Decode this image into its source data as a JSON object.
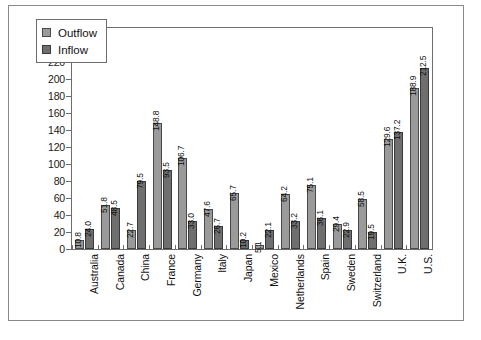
{
  "chart_data": {
    "type": "bar",
    "title": "",
    "xlabel": "",
    "ylabel": "",
    "ylim": [
      0,
      260
    ],
    "ytick_step": 20,
    "yticks": [
      0,
      20,
      40,
      60,
      80,
      100,
      120,
      140,
      160,
      180,
      200,
      220,
      240,
      260
    ],
    "grid": false,
    "legend_position": "top-left-inside",
    "categories": [
      "Australia",
      "Canada",
      "China",
      "France",
      "Germany",
      "Italy",
      "Japan",
      "Mexico",
      "Netherlands",
      "Spain",
      "Sweden",
      "Switzerland",
      "U.K.",
      "U.S."
    ],
    "series": [
      {
        "name": "Outflow",
        "color": "#9a9a9a",
        "values": [
          10.8,
          51.8,
          22.7,
          148.8,
          106.7,
          47.6,
          65.7,
          5.1,
          64.2,
          75.1,
          29.4,
          58.5,
          129.6,
          188.9
        ],
        "labels": [
          "10.8",
          "51.8",
          "22.7",
          "148.8",
          "106.7",
          "47.6",
          "65.7",
          "5.1",
          "64.2",
          "75.1",
          "29.4",
          "58.5",
          "129.6",
          "188.9"
        ]
      },
      {
        "name": "Inflow",
        "color": "#6f6f6f",
        "values": [
          24.0,
          48.5,
          79.5,
          93.5,
          33.0,
          26.7,
          10.2,
          22.1,
          33.2,
          36.1,
          22.9,
          19.5,
          137.2,
          212.5
        ],
        "labels": [
          "24.0",
          "48.5",
          "79.5",
          "93.5",
          "33.0",
          "26.7",
          "10.2",
          "22.1",
          "33.2",
          "36.1",
          "22.9",
          "19.5",
          "137.2",
          "212.5"
        ]
      }
    ]
  },
  "legend": {
    "items": [
      {
        "label": "Outflow"
      },
      {
        "label": "Inflow"
      }
    ]
  }
}
